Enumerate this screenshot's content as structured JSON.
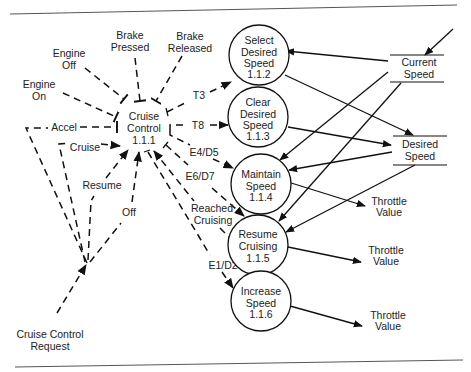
{
  "diagram": {
    "control_process": {
      "label_lines": [
        "Cruise",
        "Control",
        "1.1.1"
      ],
      "id": "1.1.1"
    },
    "processes": [
      {
        "id": "1.1.2",
        "lines": [
          "Select",
          "Desired",
          "Speed",
          "1.1.2"
        ]
      },
      {
        "id": "1.1.3",
        "lines": [
          "Clear",
          "Desired",
          "Speed",
          "1.1.3"
        ]
      },
      {
        "id": "1.1.4",
        "lines": [
          "Maintain",
          "Speed",
          "1.1.4"
        ]
      },
      {
        "id": "1.1.5",
        "lines": [
          "Resume",
          "Cruising",
          "1.1.5"
        ]
      },
      {
        "id": "1.1.6",
        "lines": [
          "Increase",
          "Speed",
          "1.1.6"
        ]
      }
    ],
    "stores": [
      {
        "name": "current-speed",
        "lines": [
          "Current",
          "Speed"
        ]
      },
      {
        "name": "desired-speed",
        "lines": [
          "Desired",
          "Speed"
        ]
      }
    ],
    "control_inputs": {
      "engine_on": [
        "Engine",
        "On"
      ],
      "engine_off": [
        "Engine",
        "Off"
      ],
      "brake_pressed": [
        "Brake",
        "Pressed"
      ],
      "brake_released": [
        "Brake",
        "Released"
      ],
      "accel": "Accel",
      "cruise": "Cruise",
      "resume": "Resume",
      "off": "Off",
      "request": [
        "Cruise Control",
        "Request"
      ]
    },
    "control_outputs": {
      "t3": "T3",
      "t8": "T8",
      "e4d5": "E4/D5",
      "e6d7": "E6/D7",
      "reached_cruising": [
        "Reached",
        "Cruising"
      ],
      "e1d2": "E1/D2"
    },
    "outputs": {
      "throttle_1": [
        "Throttle",
        "Value"
      ],
      "throttle_2": [
        "Throttle",
        "Value"
      ],
      "throttle_3": [
        "Throttle",
        "Value"
      ]
    }
  }
}
